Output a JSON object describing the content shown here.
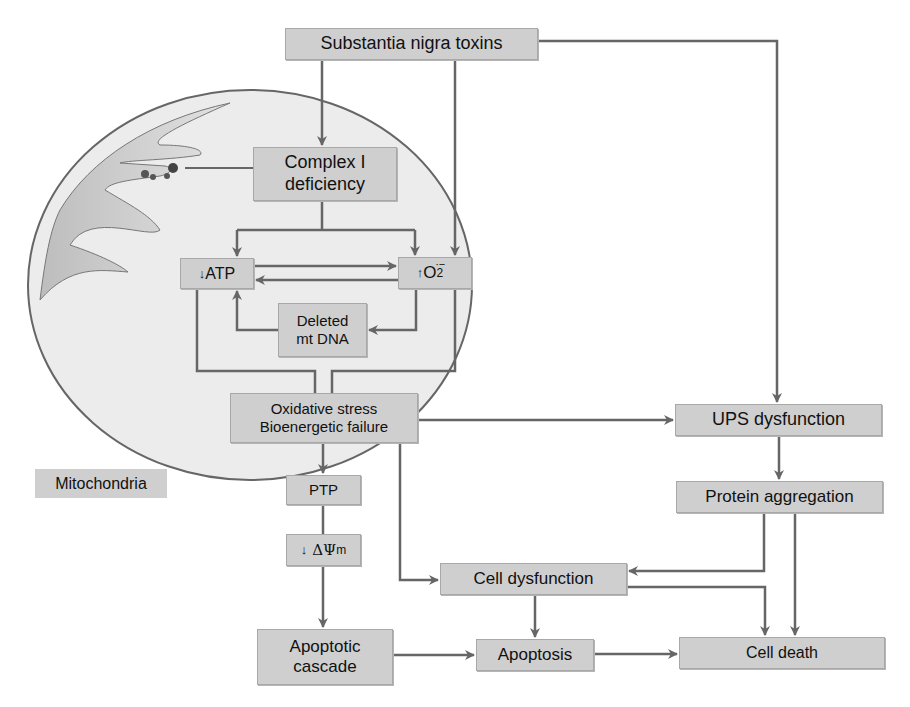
{
  "diagram": {
    "container_label": "Mitochondria",
    "nodes": {
      "toxins": {
        "label": "Substantia nigra toxins"
      },
      "complex1": {
        "line1": "Complex I",
        "line2": "deficiency"
      },
      "atp": {
        "arrow": "↓",
        "label": "ATP"
      },
      "o2": {
        "arrow": "↑",
        "label": "O",
        "sub": "2",
        "sup": "·−"
      },
      "mtdna": {
        "line1": "Deleted",
        "line2": "mt DNA"
      },
      "oxidative": {
        "line1": "Oxidative stress",
        "line2": "Bioenergetic failure"
      },
      "ptp": {
        "label": "PTP"
      },
      "psi": {
        "arrow": "↓",
        "label": "ΔΨ",
        "sub": "m"
      },
      "apoptotic_cascade": {
        "line1": "Apoptotic",
        "line2": "cascade"
      },
      "ups": {
        "label": "UPS dysfunction"
      },
      "protein": {
        "label": "Protein aggregation"
      },
      "cell_dysfunction": {
        "label": "Cell dysfunction"
      },
      "apoptosis": {
        "label": "Apoptosis"
      },
      "cell_death": {
        "label": "Cell death"
      }
    },
    "edges": [
      [
        "toxins",
        "complex1"
      ],
      [
        "toxins",
        "o2"
      ],
      [
        "toxins",
        "ups"
      ],
      [
        "complex1",
        "atp"
      ],
      [
        "complex1",
        "o2"
      ],
      [
        "atp",
        "o2"
      ],
      [
        "o2",
        "atp"
      ],
      [
        "o2",
        "mtdna"
      ],
      [
        "mtdna",
        "atp"
      ],
      [
        "atp",
        "oxidative"
      ],
      [
        "o2",
        "oxidative"
      ],
      [
        "oxidative",
        "ups"
      ],
      [
        "oxidative",
        "ptp"
      ],
      [
        "oxidative",
        "cell_dysfunction"
      ],
      [
        "ptp",
        "psi"
      ],
      [
        "psi",
        "apoptotic_cascade"
      ],
      [
        "apoptotic_cascade",
        "apoptosis"
      ],
      [
        "ups",
        "protein"
      ],
      [
        "protein",
        "cell_dysfunction"
      ],
      [
        "protein",
        "cell_death"
      ],
      [
        "cell_dysfunction",
        "apoptosis"
      ],
      [
        "cell_dysfunction",
        "cell_death"
      ],
      [
        "apoptosis",
        "cell_death"
      ]
    ],
    "colors": {
      "box_fill": "#cfcfcf",
      "line": "#666666",
      "mito_fill": "#ececec"
    }
  }
}
